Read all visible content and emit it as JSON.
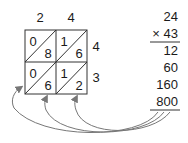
{
  "lattice": {
    "top_digits": [
      "2",
      "4"
    ],
    "side_digits": [
      "4",
      "3"
    ],
    "cells": [
      [
        {
          "tens": "0",
          "ones": "8"
        },
        {
          "tens": "1",
          "ones": "6"
        }
      ],
      [
        {
          "tens": "0",
          "ones": "6"
        },
        {
          "tens": "1",
          "ones": "2"
        }
      ]
    ]
  },
  "column_method": {
    "multiplicand": "24",
    "multiplier": "× 43",
    "partial_products": [
      "12",
      "60",
      "160",
      "800"
    ]
  },
  "colors": {
    "ink": "#1a1a1a",
    "arrow": "#777777",
    "grid": "#333333"
  }
}
